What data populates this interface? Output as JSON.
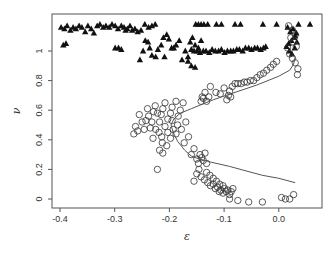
{
  "chart_data": {
    "type": "scatter",
    "title": "",
    "xlabel": "ε",
    "ylabel": "ν",
    "xlim": [
      -0.415,
      0.078
    ],
    "ylim": [
      -0.06,
      1.25
    ],
    "grid": false,
    "legend": "none",
    "x_ticks": [
      -0.4,
      -0.3,
      -0.2,
      -0.1,
      0.0
    ],
    "x_tick_labels": [
      "-0.4",
      "-0.3",
      "-0.2",
      "-0.1",
      "0.0"
    ],
    "y_ticks": [
      0,
      0.2,
      0.4,
      0.6,
      0.8,
      1.0
    ],
    "y_tick_labels": [
      "0",
      "0.2",
      "0.4",
      "0.6",
      "0.8",
      "1"
    ],
    "series": [
      {
        "name": "triangles",
        "marker": "filled-triangle",
        "color": "#111111",
        "points": [
          [
            -0.398,
            1.16
          ],
          [
            -0.392,
            1.15
          ],
          [
            -0.387,
            1.17
          ],
          [
            -0.381,
            1.14
          ],
          [
            -0.376,
            1.16
          ],
          [
            -0.371,
            1.15
          ],
          [
            -0.365,
            1.17
          ],
          [
            -0.36,
            1.16
          ],
          [
            -0.354,
            1.13
          ],
          [
            -0.349,
            1.17
          ],
          [
            -0.343,
            1.15
          ],
          [
            -0.338,
            1.12
          ],
          [
            -0.332,
            1.17
          ],
          [
            -0.327,
            1.18
          ],
          [
            -0.321,
            1.16
          ],
          [
            -0.316,
            1.17
          ],
          [
            -0.31,
            1.16
          ],
          [
            -0.305,
            1.18
          ],
          [
            -0.299,
            1.17
          ],
          [
            -0.294,
            1.15
          ],
          [
            -0.288,
            1.17
          ],
          [
            -0.283,
            1.16
          ],
          [
            -0.28,
            1.14
          ],
          [
            -0.277,
            1.15
          ],
          [
            -0.272,
            1.17
          ],
          [
            -0.268,
            1.14
          ],
          [
            -0.263,
            1.15
          ],
          [
            -0.258,
            1.13
          ],
          [
            -0.252,
            1.14
          ],
          [
            -0.245,
            1.18
          ],
          [
            -0.238,
            1.16
          ],
          [
            -0.232,
            1.17
          ],
          [
            -0.226,
            1.18
          ],
          [
            -0.394,
            1.04
          ],
          [
            -0.389,
            1.05
          ],
          [
            -0.299,
            1.02
          ],
          [
            -0.293,
            1.02
          ],
          [
            -0.288,
            1.01
          ],
          [
            -0.254,
            0.94
          ],
          [
            -0.248,
            1.0
          ],
          [
            -0.244,
            1.07
          ],
          [
            -0.239,
            1.06
          ],
          [
            -0.236,
            1.02
          ],
          [
            -0.232,
            0.97
          ],
          [
            -0.225,
            0.96
          ],
          [
            -0.221,
            1.01
          ],
          [
            -0.215,
            1.04
          ],
          [
            -0.211,
            1.09
          ],
          [
            -0.209,
            0.96
          ],
          [
            -0.205,
            1.11
          ],
          [
            -0.201,
            1.08
          ],
          [
            -0.196,
            1.02
          ],
          [
            -0.192,
            1.02
          ],
          [
            -0.188,
            1.04
          ],
          [
            -0.182,
            1.07
          ],
          [
            -0.177,
            0.94
          ],
          [
            -0.171,
            1.0
          ],
          [
            -0.166,
            0.96
          ],
          [
            -0.16,
            1.01
          ],
          [
            -0.155,
            1.0
          ],
          [
            -0.149,
            1.0
          ],
          [
            -0.144,
            0.99
          ],
          [
            -0.138,
            1.0
          ],
          [
            -0.133,
            1.0
          ],
          [
            -0.127,
            0.99
          ],
          [
            -0.122,
            1.01
          ],
          [
            -0.116,
            1.0
          ],
          [
            -0.11,
            1.0
          ],
          [
            -0.105,
            1.01
          ],
          [
            -0.099,
            0.99
          ],
          [
            -0.094,
            1.0
          ],
          [
            -0.088,
            1.0
          ],
          [
            -0.083,
            1.0
          ],
          [
            -0.077,
            1.01
          ],
          [
            -0.072,
            1.01
          ],
          [
            -0.066,
            1.0
          ],
          [
            -0.061,
            1.02
          ],
          [
            -0.055,
            1.02
          ],
          [
            -0.05,
            1.01
          ],
          [
            -0.044,
            1.02
          ],
          [
            -0.039,
            1.02
          ],
          [
            -0.033,
            1.01
          ],
          [
            -0.028,
            1.02
          ],
          [
            -0.024,
            1.03
          ],
          [
            -0.166,
            0.93
          ],
          [
            -0.16,
            0.9
          ],
          [
            -0.153,
            0.89
          ],
          [
            -0.162,
            1.06
          ],
          [
            -0.158,
            1.09
          ],
          [
            -0.153,
            1.04
          ],
          [
            -0.147,
            1.02
          ],
          [
            -0.142,
            1.07
          ],
          [
            -0.152,
            1.18
          ],
          [
            -0.147,
            1.18
          ],
          [
            -0.142,
            1.18
          ],
          [
            -0.137,
            1.18
          ],
          [
            -0.13,
            1.18
          ],
          [
            -0.114,
            1.18
          ],
          [
            -0.105,
            1.18
          ],
          [
            -0.08,
            1.18
          ],
          [
            -0.07,
            1.18
          ],
          [
            -0.029,
            1.18
          ],
          [
            -0.004,
            1.18
          ],
          [
            0.036,
            1.18
          ],
          [
            0.057,
            1.18
          ],
          [
            0.016,
            1.16
          ],
          [
            0.021,
            1.13
          ],
          [
            0.026,
            1.15
          ],
          [
            0.032,
            1.12
          ],
          [
            0.028,
            1.09
          ],
          [
            0.023,
            1.07
          ],
          [
            0.018,
            1.05
          ],
          [
            0.014,
            1.03
          ],
          [
            0.019,
            1.0
          ],
          [
            0.024,
            0.98
          ],
          [
            0.029,
            1.02
          ],
          [
            0.033,
            1.06
          ],
          [
            0.03,
            1.1
          ]
        ]
      },
      {
        "name": "circles",
        "marker": "open-circle",
        "color": "#333333",
        "points": [
          [
            0.018,
            1.17
          ],
          [
            0.025,
            1.14
          ],
          [
            0.03,
            1.11
          ],
          [
            0.022,
            1.09
          ],
          [
            0.027,
            1.06
          ],
          [
            0.032,
            1.03
          ],
          [
            0.016,
            1.02
          ],
          [
            0.02,
            0.98
          ],
          [
            0.025,
            0.95
          ],
          [
            0.03,
            0.92
          ],
          [
            0.035,
            0.88
          ],
          [
            0.034,
            0.84
          ],
          [
            -0.004,
            0.93
          ],
          [
            -0.01,
            0.91
          ],
          [
            -0.015,
            0.89
          ],
          [
            -0.022,
            0.87
          ],
          [
            -0.028,
            0.85
          ],
          [
            -0.034,
            0.84
          ],
          [
            -0.04,
            0.82
          ],
          [
            -0.046,
            0.8
          ],
          [
            -0.052,
            0.8
          ],
          [
            -0.058,
            0.79
          ],
          [
            -0.063,
            0.79
          ],
          [
            -0.069,
            0.78
          ],
          [
            -0.075,
            0.78
          ],
          [
            -0.08,
            0.78
          ],
          [
            -0.085,
            0.76
          ],
          [
            -0.09,
            0.73
          ],
          [
            -0.092,
            0.7
          ],
          [
            -0.088,
            0.69
          ],
          [
            -0.095,
            0.67
          ],
          [
            -0.1,
            0.75
          ],
          [
            -0.107,
            0.71
          ],
          [
            -0.115,
            0.72
          ],
          [
            -0.125,
            0.76
          ],
          [
            -0.135,
            0.72
          ],
          [
            -0.138,
            0.68
          ],
          [
            -0.132,
            0.66
          ],
          [
            -0.128,
            0.69
          ],
          [
            -0.14,
            0.69
          ],
          [
            -0.142,
            0.66
          ],
          [
            -0.175,
            0.65
          ],
          [
            -0.18,
            0.6
          ],
          [
            -0.184,
            0.56
          ],
          [
            -0.188,
            0.66
          ],
          [
            -0.195,
            0.62
          ],
          [
            -0.198,
            0.58
          ],
          [
            -0.203,
            0.54
          ],
          [
            -0.208,
            0.65
          ],
          [
            -0.212,
            0.61
          ],
          [
            -0.215,
            0.57
          ],
          [
            -0.218,
            0.52
          ],
          [
            -0.222,
            0.58
          ],
          [
            -0.226,
            0.63
          ],
          [
            -0.229,
            0.59
          ],
          [
            -0.232,
            0.52
          ],
          [
            -0.235,
            0.48
          ],
          [
            -0.238,
            0.56
          ],
          [
            -0.24,
            0.61
          ],
          [
            -0.243,
            0.53
          ],
          [
            -0.246,
            0.47
          ],
          [
            -0.25,
            0.52
          ],
          [
            -0.255,
            0.57
          ],
          [
            -0.258,
            0.46
          ],
          [
            -0.262,
            0.49
          ],
          [
            -0.265,
            0.44
          ],
          [
            -0.23,
            0.41
          ],
          [
            -0.225,
            0.47
          ],
          [
            -0.219,
            0.45
          ],
          [
            -0.214,
            0.42
          ],
          [
            -0.208,
            0.49
          ],
          [
            -0.203,
            0.45
          ],
          [
            -0.198,
            0.41
          ],
          [
            -0.193,
            0.47
          ],
          [
            -0.188,
            0.44
          ],
          [
            -0.205,
            0.36
          ],
          [
            -0.212,
            0.31
          ],
          [
            -0.218,
            0.33
          ],
          [
            -0.222,
            0.2
          ],
          [
            -0.213,
            0.38
          ],
          [
            -0.195,
            0.53
          ],
          [
            -0.185,
            0.5
          ],
          [
            -0.178,
            0.47
          ],
          [
            -0.17,
            0.52
          ],
          [
            -0.165,
            0.42
          ],
          [
            -0.173,
            0.38
          ],
          [
            -0.16,
            0.3
          ],
          [
            -0.155,
            0.34
          ],
          [
            -0.15,
            0.27
          ],
          [
            -0.147,
            0.24
          ],
          [
            -0.144,
            0.3
          ],
          [
            -0.141,
            0.28
          ],
          [
            -0.138,
            0.26
          ],
          [
            -0.135,
            0.31
          ],
          [
            -0.132,
            0.24
          ],
          [
            -0.146,
            0.2
          ],
          [
            -0.15,
            0.17
          ],
          [
            -0.155,
            0.12
          ],
          [
            -0.142,
            0.15
          ],
          [
            -0.136,
            0.13
          ],
          [
            -0.13,
            0.11
          ],
          [
            -0.125,
            0.09
          ],
          [
            -0.12,
            0.1
          ],
          [
            -0.116,
            0.07
          ],
          [
            -0.112,
            0.08
          ],
          [
            -0.109,
            0.05
          ],
          [
            -0.106,
            0.06
          ],
          [
            -0.102,
            0.04
          ],
          [
            -0.099,
            0.07
          ],
          [
            -0.096,
            0.05
          ],
          [
            -0.093,
            0.06
          ],
          [
            -0.09,
            0.03
          ],
          [
            -0.087,
            0.05
          ],
          [
            -0.084,
            0.07
          ],
          [
            -0.108,
            0.1
          ],
          [
            -0.102,
            0.09
          ],
          [
            -0.114,
            0.12
          ],
          [
            -0.12,
            0.14
          ],
          [
            -0.126,
            0.16
          ],
          [
            -0.132,
            0.18
          ],
          [
            -0.09,
            0.0
          ],
          [
            -0.075,
            -0.01
          ],
          [
            -0.055,
            -0.02
          ],
          [
            -0.03,
            -0.02
          ],
          [
            0.005,
            0.01
          ],
          [
            0.012,
            0.0
          ],
          [
            0.02,
            0.0
          ],
          [
            0.027,
            0.03
          ]
        ]
      },
      {
        "name": "fit-line",
        "marker": "line",
        "color": "#555555",
        "points": [
          [
            0.03,
            0.96
          ],
          [
            0.027,
            0.91
          ],
          [
            0.02,
            0.87
          ],
          [
            0.0,
            0.83
          ],
          [
            -0.04,
            0.77
          ],
          [
            -0.08,
            0.72
          ],
          [
            -0.12,
            0.67
          ],
          [
            -0.16,
            0.61
          ],
          [
            -0.18,
            0.58
          ],
          [
            -0.192,
            0.54
          ],
          [
            -0.197,
            0.5
          ],
          [
            -0.193,
            0.45
          ],
          [
            -0.185,
            0.39
          ],
          [
            -0.172,
            0.33
          ],
          [
            -0.16,
            0.29
          ],
          [
            -0.145,
            0.27
          ],
          [
            -0.125,
            0.25
          ],
          [
            -0.09,
            0.22
          ],
          [
            -0.06,
            0.19
          ],
          [
            -0.03,
            0.16
          ],
          [
            0.0,
            0.14
          ],
          [
            0.03,
            0.11
          ]
        ]
      }
    ]
  }
}
